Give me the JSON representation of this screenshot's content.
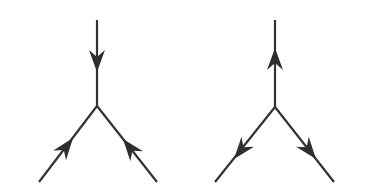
{
  "diagram": {
    "background": "#ffffff",
    "stroke_color": "#333333",
    "arrowhead_color": "#2e2e2e",
    "vertices": [
      {
        "id": "left-vertex",
        "label": "all arrows pointing into vertex",
        "center": [
          97,
          106
        ],
        "legs": [
          {
            "name": "top",
            "end": [
              97,
              20
            ],
            "arrow": "inward"
          },
          {
            "name": "lower-left",
            "end": [
              39,
              182
            ],
            "arrow": "inward"
          },
          {
            "name": "lower-right",
            "end": [
              157,
              182
            ],
            "arrow": "inward"
          }
        ]
      },
      {
        "id": "right-vertex",
        "label": "all arrows pointing out of vertex",
        "center": [
          275,
          107
        ],
        "legs": [
          {
            "name": "top",
            "end": [
              275,
              20
            ],
            "arrow": "outward"
          },
          {
            "name": "lower-left",
            "end": [
              215,
              182
            ],
            "arrow": "outward"
          },
          {
            "name": "lower-right",
            "end": [
              334,
              182
            ],
            "arrow": "outward"
          }
        ]
      }
    ]
  }
}
